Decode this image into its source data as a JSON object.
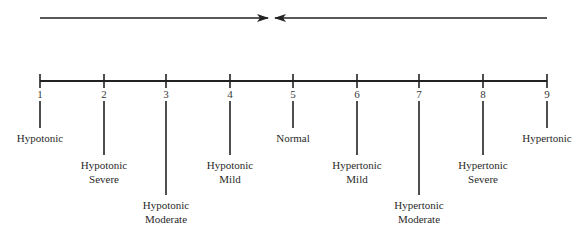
{
  "diagram": {
    "type": "tonicity-scale",
    "arrows": [
      {
        "direction": "right",
        "x1": 40,
        "x2": 268,
        "y": 18
      },
      {
        "direction": "left",
        "x1": 547,
        "x2": 275,
        "y": 18
      }
    ],
    "axis": {
      "y": 81,
      "x_start": 40,
      "x_end": 547
    },
    "ticks": [
      {
        "number": "1",
        "x": 40,
        "line_end": 128,
        "label_lines": [
          "Hypotonic"
        ]
      },
      {
        "number": "2",
        "x": 104,
        "line_end": 155,
        "label_lines": [
          "Hypotonic",
          "Severe"
        ]
      },
      {
        "number": "3",
        "x": 166,
        "line_end": 195,
        "label_lines": [
          "Hypotonic",
          "Moderate"
        ]
      },
      {
        "number": "4",
        "x": 230,
        "line_end": 155,
        "label_lines": [
          "Hypotonic",
          "Mild"
        ]
      },
      {
        "number": "5",
        "x": 293,
        "line_end": 128,
        "label_lines": [
          "Normal"
        ]
      },
      {
        "number": "6",
        "x": 357,
        "line_end": 155,
        "label_lines": [
          "Hypertonic",
          "Mild"
        ]
      },
      {
        "number": "7",
        "x": 419,
        "line_end": 195,
        "label_lines": [
          "Hypertonic",
          "Moderate"
        ]
      },
      {
        "number": "8",
        "x": 483,
        "line_end": 155,
        "label_lines": [
          "Hypertonic",
          "Severe"
        ]
      },
      {
        "number": "9",
        "x": 547,
        "line_end": 128,
        "label_lines": [
          "Hypertonic"
        ]
      }
    ],
    "colors": {
      "line": "#222222",
      "text": "#2a2a2a"
    }
  }
}
